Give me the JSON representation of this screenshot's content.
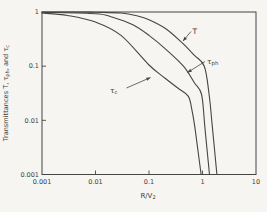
{
  "figure": {
    "bg": "#f6f5f1",
    "line_color": "#454545",
    "text_color": "#3d3d3d"
  },
  "chart_data": {
    "type": "line",
    "x_scale": "log",
    "y_scale": "log",
    "xlim": [
      0.001,
      10
    ],
    "ylim": [
      0.001,
      1
    ],
    "grid": false,
    "xlabel": {
      "main": "R/V",
      "sub": "2"
    },
    "ylabel_parts": [
      {
        "t": "Transmittances T, τ",
        "sub": false
      },
      {
        "t": "ph",
        "sub": true
      },
      {
        "t": ", and τ",
        "sub": false
      },
      {
        "t": "c",
        "sub": true
      }
    ],
    "x_ticks": {
      "values": [
        0.001,
        0.01,
        0.1,
        1,
        10
      ],
      "labels": [
        "0.001",
        "0.01",
        "0.1",
        "1",
        "10"
      ]
    },
    "y_ticks": {
      "values": [
        1,
        0.1,
        0.01,
        0.001
      ],
      "labels": [
        "1",
        "0.1",
        "0.01",
        "0.001"
      ]
    },
    "series": [
      {
        "name": "T",
        "points": [
          [
            0.001,
            1.0
          ],
          [
            0.004,
            1.0
          ],
          [
            0.01,
            0.99
          ],
          [
            0.03,
            0.96
          ],
          [
            0.06,
            0.85
          ],
          [
            0.1,
            0.72
          ],
          [
            0.2,
            0.5
          ],
          [
            0.4,
            0.28
          ],
          [
            0.7,
            0.16
          ],
          [
            1.08,
            0.1
          ],
          [
            1.33,
            0.03
          ],
          [
            1.53,
            0.0074
          ],
          [
            1.86,
            0.001
          ]
        ]
      },
      {
        "name": "τph",
        "points": [
          [
            0.001,
            0.99
          ],
          [
            0.01,
            0.93
          ],
          [
            0.021,
            0.8
          ],
          [
            0.05,
            0.58
          ],
          [
            0.1,
            0.37
          ],
          [
            0.2,
            0.21
          ],
          [
            0.44,
            0.1
          ],
          [
            0.7,
            0.05
          ],
          [
            0.96,
            0.03
          ],
          [
            1.11,
            0.0074
          ],
          [
            1.35,
            0.001
          ]
        ]
      },
      {
        "name": "τc",
        "points": [
          [
            0.001,
            0.96
          ],
          [
            0.003,
            0.86
          ],
          [
            0.01,
            0.65
          ],
          [
            0.03,
            0.37
          ],
          [
            0.1,
            0.105
          ],
          [
            0.2,
            0.06
          ],
          [
            0.35,
            0.039
          ],
          [
            0.54,
            0.028
          ],
          [
            0.63,
            0.016
          ],
          [
            0.72,
            0.0074
          ],
          [
            0.94,
            0.001
          ]
        ]
      }
    ],
    "annotations": [
      {
        "id": "label-T",
        "main": "T",
        "sub": "",
        "tx": 192.5,
        "ty": 34,
        "line": [
          191.0,
          31.5,
          183.0,
          41.0
        ]
      },
      {
        "id": "label-tau-ph",
        "main": "τ",
        "sub": "ph",
        "tx": 207.0,
        "ty": 63.5,
        "line": [
          205.0,
          61.5,
          187.5,
          72.5
        ]
      },
      {
        "id": "label-tau-c",
        "main": "τ",
        "sub": "c",
        "tx": 110.0,
        "ty": 92.5,
        "line": [
          126.5,
          88.0,
          150.5,
          77.5
        ]
      }
    ]
  }
}
